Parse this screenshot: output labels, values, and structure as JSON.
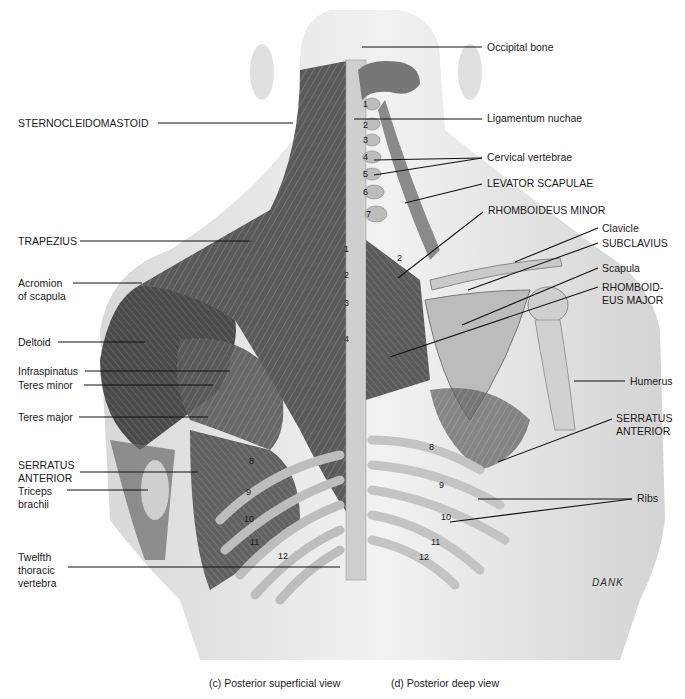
{
  "figure": {
    "captions": {
      "left": "(c) Posterior superficial view",
      "right": "(d) Posterior deep view"
    },
    "signature": "DANK"
  },
  "labels_left": [
    {
      "id": "sternocleidomastoid",
      "text": "STERNOCLEIDOMASTOID",
      "x": 18,
      "y": 118
    },
    {
      "id": "trapezius",
      "text": "TRAPEZIUS",
      "x": 18,
      "y": 236
    },
    {
      "id": "acromion",
      "text": "Acromion\nof scapula",
      "x": 18,
      "y": 278
    },
    {
      "id": "deltoid",
      "text": "Deltoid",
      "x": 18,
      "y": 335
    },
    {
      "id": "infraspinatus",
      "text": "Infraspinatus",
      "x": 18,
      "y": 364
    },
    {
      "id": "teres-minor",
      "text": "Teres minor",
      "x": 18,
      "y": 378
    },
    {
      "id": "teres-major",
      "text": "Teres major",
      "x": 18,
      "y": 410
    },
    {
      "id": "serratus-anterior-left",
      "text": "SERRATUS\nANTERIOR",
      "x": 18,
      "y": 459
    },
    {
      "id": "triceps",
      "text": "Triceps\nbrachii",
      "x": 18,
      "y": 486
    },
    {
      "id": "twelfth-thoracic",
      "text": "Twelfth\nthoracic\nvertebra",
      "x": 18,
      "y": 552
    }
  ],
  "labels_right": [
    {
      "id": "occipital",
      "text": "Occipital bone",
      "x": 487,
      "y": 40
    },
    {
      "id": "ligamentum",
      "text": "Ligamentum nuchae",
      "x": 487,
      "y": 112
    },
    {
      "id": "cervical",
      "text": "Cervical vertebrae",
      "x": 487,
      "y": 151
    },
    {
      "id": "levator",
      "text": "LEVATOR SCAPULAE",
      "x": 487,
      "y": 178
    },
    {
      "id": "rhomboid-minor",
      "text": "RHOMBOIDEUS MINOR",
      "x": 488,
      "y": 204
    },
    {
      "id": "clavicle",
      "text": "Clavicle",
      "x": 602,
      "y": 222
    },
    {
      "id": "subclavius",
      "text": "SUBCLAVIUS",
      "x": 602,
      "y": 238
    },
    {
      "id": "scapula",
      "text": "Scapula",
      "x": 602,
      "y": 262
    },
    {
      "id": "rhomboid-major",
      "text": "RHOMBOID-\nEUS MAJOR",
      "x": 602,
      "y": 282
    },
    {
      "id": "humerus",
      "text": "Humerus",
      "x": 630,
      "y": 375
    },
    {
      "id": "serratus-anterior-right",
      "text": "SERRATUS\nANTERIOR",
      "x": 616,
      "y": 413
    },
    {
      "id": "ribs",
      "text": "Ribs",
      "x": 637,
      "y": 492
    }
  ],
  "vertebra_numbers_cervical": [
    "1",
    "2",
    "3",
    "4",
    "5",
    "6",
    "7"
  ],
  "vertebra_numbers_thoracic": [
    "1",
    "2",
    "3",
    "4"
  ],
  "rib_numbers_left": [
    "8",
    "9",
    "10",
    "11",
    "12"
  ],
  "rib_numbers_right": [
    "8",
    "9",
    "10",
    "11",
    "12"
  ],
  "deep_rib_upper": [
    "2"
  ]
}
